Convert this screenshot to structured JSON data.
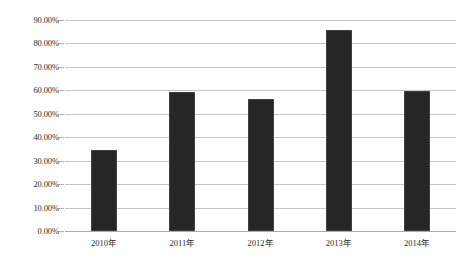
{
  "chart_data": {
    "type": "bar",
    "title": "",
    "subtitle": "",
    "xlabel": "",
    "ylabel": "",
    "categories": [
      "2010年",
      "2011年",
      "2012年",
      "2013年",
      "2014年"
    ],
    "values": [
      34.7,
      59.5,
      56.5,
      85.7,
      59.8
    ],
    "value_labels": [
      "34.70%",
      "59.50%",
      "56.50%",
      "85.70%",
      "59.80%"
    ],
    "ylim": [
      0,
      90
    ],
    "ytick_values": [
      0,
      10,
      20,
      30,
      40,
      50,
      60,
      70,
      80,
      90
    ],
    "ytick_labels": [
      "0.00%",
      "10.00%",
      "20.00%",
      "30.00%",
      "40.00%",
      "50.00%",
      "60.00%",
      "70.00%",
      "80.00%",
      "90.00%"
    ],
    "grid": true,
    "grid_axis": "y",
    "legend": false,
    "legend_position": "none",
    "series": [
      {
        "name": "",
        "color": "#262626",
        "values": [
          34.7,
          59.5,
          56.5,
          85.7,
          59.8
        ]
      }
    ],
    "annotations": []
  },
  "style": {
    "bar_color": "#262626",
    "grid_color": "#c4c4c4",
    "axis_color": "#a9a9a9",
    "background": "#ffffff",
    "text_color": "#2b2b2b"
  }
}
